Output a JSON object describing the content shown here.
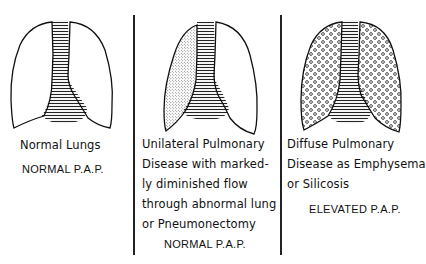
{
  "panels": [
    {
      "id": "normal",
      "caption_lines": [
        "Normal Lungs"
      ],
      "pap_label": "NORMAL P.A.P.",
      "left_lung_fill": "none",
      "right_lung_fill": "none"
    },
    {
      "id": "unilateral",
      "caption_lines": [
        "Unilateral Pulmonary",
        "Disease with marked-",
        "ly diminished flow",
        "through abnormal lung",
        "or Pneumonectomy"
      ],
      "pap_label": "NORMAL P.A.P.",
      "left_lung_fill": "stippled",
      "right_lung_fill": "none"
    },
    {
      "id": "diffuse",
      "caption_lines": [
        "Diffuse Pulmonary",
        "Disease as Emphysema",
        "or Silicosis"
      ],
      "pap_label": "ELEVATED P.A.P.",
      "left_lung_fill": "circles",
      "right_lung_fill": "circles"
    }
  ],
  "colors": {
    "ink": "#111111",
    "background": "#ffffff"
  }
}
